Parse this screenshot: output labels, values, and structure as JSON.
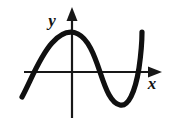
{
  "figure": {
    "kind": "cartesian-plot",
    "background_color": "#ffffff",
    "ink_color": "#101010",
    "axes": {
      "x_axis": {
        "label": "x",
        "label_position": {
          "x": 152,
          "y": 89
        },
        "line": {
          "x1": 24,
          "y1": 72,
          "x2": 152,
          "y2": 72
        },
        "arrow_tip_x": 161,
        "arrowhead": "162,72 148,66.5 148,77.5"
      },
      "y_axis": {
        "label": "y",
        "label_position": {
          "x": 52,
          "y": 26
        },
        "line": {
          "x1": 72,
          "y1": 16,
          "x2": 72,
          "y2": 118
        },
        "arrow_tip_y": 8,
        "arrowhead": "72,7 66.5,21 77.5,21"
      },
      "origin": {
        "x": 72,
        "y": 72
      }
    },
    "curve": {
      "description": "cubic-like wave rising from lower left, crest left of origin, trough right of origin, steep rise at right",
      "stroke_width": 5.2,
      "path": "M 22,97 C 31,80 40,56 52,43 C 61,33 70,30 78,34 C 88,39 94,54 100,72 C 106,90 111,103 120,105 C 128,107 135,93 139,68 C 141,54 142,42 142,32",
      "key_points": {
        "left_end": {
          "x": 22,
          "y": 97
        },
        "left_x_crossing": {
          "x": 28,
          "y": 72
        },
        "crest": {
          "x": 70,
          "y": 33
        },
        "middle_x_crossing": {
          "x": 100,
          "y": 72
        },
        "trough": {
          "x": 124,
          "y": 105
        },
        "right_x_crossing": {
          "x": 141,
          "y": 72
        },
        "right_end": {
          "x": 142,
          "y": 32
        }
      }
    }
  }
}
